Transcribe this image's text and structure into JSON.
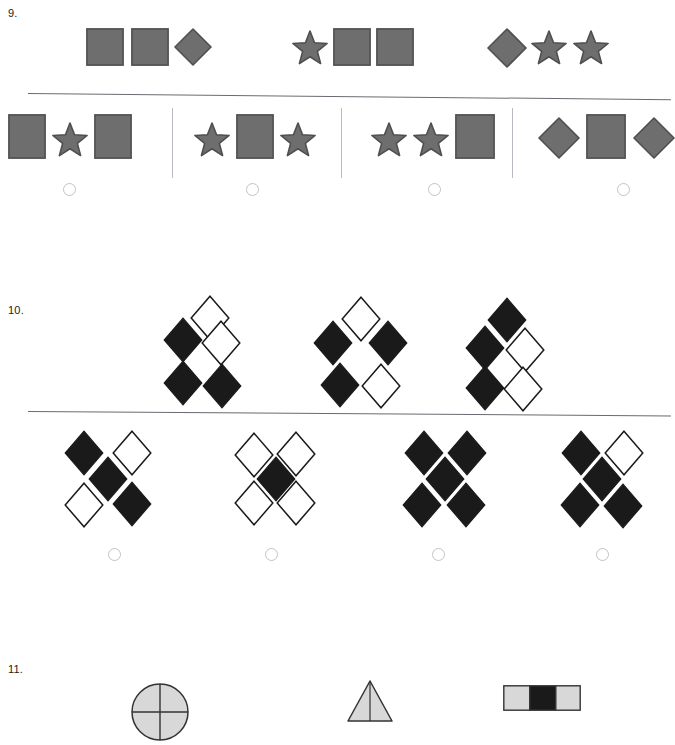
{
  "page": {
    "width": 671,
    "height": 700,
    "background": "#ffffff",
    "type": "abstract-reasoning-worksheet"
  },
  "colors": {
    "gray_fill": "#6e6e6e",
    "gray_stroke": "#4f4f4f",
    "black_fill": "#1a1a1a",
    "white_fill": "#ffffff",
    "divider": "#6a6a72",
    "separator": "#b9b9c2",
    "radio_border": "#c3c3c8",
    "text": "#222222",
    "light_gray_fill": "#d8d8d8"
  },
  "questions": [
    {
      "number": "9.",
      "number_pos": {
        "x": 8,
        "y": 8
      },
      "divider": {
        "x": 28,
        "y": 93,
        "width": 643,
        "angle": 0.55
      },
      "prompt": {
        "label": "sequence-prompt",
        "groups": [
          {
            "name": "prompt-group-1",
            "shapes": [
              {
                "kind": "square",
                "x": 86,
                "y": 28,
                "w": 38,
                "h": 38
              },
              {
                "kind": "square",
                "x": 131,
                "y": 28,
                "w": 38,
                "h": 38
              },
              {
                "kind": "diamond",
                "x": 174,
                "y": 28,
                "w": 38,
                "h": 38
              }
            ]
          },
          {
            "name": "prompt-group-2",
            "shapes": [
              {
                "kind": "star",
                "x": 291,
                "y": 29,
                "w": 38,
                "h": 38
              },
              {
                "kind": "square",
                "x": 333,
                "y": 28,
                "w": 38,
                "h": 38
              },
              {
                "kind": "square",
                "x": 376,
                "y": 28,
                "w": 38,
                "h": 38
              }
            ]
          },
          {
            "name": "prompt-group-3",
            "shapes": [
              {
                "kind": "diamond",
                "x": 487,
                "y": 28,
                "w": 40,
                "h": 40
              },
              {
                "kind": "star",
                "x": 530,
                "y": 29,
                "w": 38,
                "h": 38
              },
              {
                "kind": "star",
                "x": 572,
                "y": 29,
                "w": 38,
                "h": 38
              }
            ]
          }
        ]
      },
      "separators": [
        {
          "x": 172,
          "y": 108,
          "height": 70
        },
        {
          "x": 341,
          "y": 108,
          "height": 70
        },
        {
          "x": 512,
          "y": 108,
          "height": 70
        }
      ],
      "options": [
        {
          "name": "option-a",
          "radio": {
            "x": 63,
            "y": 183
          },
          "shapes": [
            {
              "kind": "square",
              "x": 8,
              "y": 114,
              "w": 38,
              "h": 45
            },
            {
              "kind": "star",
              "x": 51,
              "y": 121,
              "w": 38,
              "h": 38
            },
            {
              "kind": "square",
              "x": 94,
              "y": 114,
              "w": 38,
              "h": 45
            }
          ]
        },
        {
          "name": "option-b",
          "radio": {
            "x": 246,
            "y": 183
          },
          "shapes": [
            {
              "kind": "star",
              "x": 193,
              "y": 121,
              "w": 38,
              "h": 38
            },
            {
              "kind": "square",
              "x": 236,
              "y": 114,
              "w": 38,
              "h": 45
            },
            {
              "kind": "star",
              "x": 279,
              "y": 121,
              "w": 38,
              "h": 38
            }
          ]
        },
        {
          "name": "option-c",
          "radio": {
            "x": 428,
            "y": 183
          },
          "shapes": [
            {
              "kind": "star",
              "x": 370,
              "y": 121,
              "w": 38,
              "h": 38
            },
            {
              "kind": "star",
              "x": 412,
              "y": 121,
              "w": 38,
              "h": 38
            },
            {
              "kind": "square",
              "x": 455,
              "y": 114,
              "w": 40,
              "h": 45
            }
          ]
        },
        {
          "name": "option-d",
          "radio": {
            "x": 617,
            "y": 183
          },
          "shapes": [
            {
              "kind": "diamond",
              "x": 538,
              "y": 117,
              "w": 42,
              "h": 42
            },
            {
              "kind": "square",
              "x": 586,
              "y": 114,
              "w": 40,
              "h": 45
            },
            {
              "kind": "diamond",
              "x": 633,
              "y": 117,
              "w": 42,
              "h": 42
            }
          ]
        }
      ]
    },
    {
      "number": "10.",
      "number_pos": {
        "x": 8,
        "y": 305
      },
      "divider": {
        "x": 28,
        "y": 411,
        "width": 643,
        "angle": 0.4
      },
      "prompt": {
        "label": "diamond-cluster-prompt",
        "groups": [
          {
            "name": "prompt-cluster-1",
            "diamonds": [
              {
                "x": 190,
                "y": 295,
                "filled": false
              },
              {
                "x": 163,
                "y": 317,
                "filled": true
              },
              {
                "x": 201,
                "y": 320,
                "filled": false
              },
              {
                "x": 163,
                "y": 360,
                "filled": true
              },
              {
                "x": 202,
                "y": 363,
                "filled": true
              }
            ]
          },
          {
            "name": "prompt-cluster-2",
            "diamonds": [
              {
                "x": 341,
                "y": 296,
                "filled": false
              },
              {
                "x": 313,
                "y": 320,
                "filled": true
              },
              {
                "x": 368,
                "y": 320,
                "filled": true
              },
              {
                "x": 320,
                "y": 362,
                "filled": true
              },
              {
                "x": 361,
                "y": 363,
                "filled": false
              }
            ]
          },
          {
            "name": "prompt-cluster-3",
            "diamonds": [
              {
                "x": 487,
                "y": 297,
                "filled": true
              },
              {
                "x": 465,
                "y": 325,
                "filled": true
              },
              {
                "x": 505,
                "y": 327,
                "filled": false
              },
              {
                "x": 465,
                "y": 365,
                "filled": true
              },
              {
                "x": 503,
                "y": 366,
                "filled": false
              }
            ]
          }
        ]
      },
      "options": [
        {
          "name": "option-a",
          "radio": {
            "x": 108,
            "y": 548
          },
          "diamonds": [
            {
              "x": 64,
              "y": 430,
              "filled": true
            },
            {
              "x": 112,
              "y": 430,
              "filled": false
            },
            {
              "x": 88,
              "y": 456,
              "filled": true
            },
            {
              "x": 64,
              "y": 482,
              "filled": false
            },
            {
              "x": 112,
              "y": 481,
              "filled": true
            }
          ]
        },
        {
          "name": "option-b",
          "radio": {
            "x": 265,
            "y": 548
          },
          "diamonds": [
            {
              "x": 234,
              "y": 432,
              "filled": false
            },
            {
              "x": 276,
              "y": 431,
              "filled": false
            },
            {
              "x": 256,
              "y": 456,
              "filled": true
            },
            {
              "x": 234,
              "y": 480,
              "filled": false
            },
            {
              "x": 276,
              "y": 480,
              "filled": false
            }
          ]
        },
        {
          "name": "option-c",
          "radio": {
            "x": 432,
            "y": 548
          },
          "diamonds": [
            {
              "x": 404,
              "y": 430,
              "filled": true
            },
            {
              "x": 447,
              "y": 430,
              "filled": true
            },
            {
              "x": 425,
              "y": 456,
              "filled": true
            },
            {
              "x": 402,
              "y": 482,
              "filled": true
            },
            {
              "x": 446,
              "y": 482,
              "filled": true
            }
          ]
        },
        {
          "name": "option-d",
          "radio": {
            "x": 596,
            "y": 548
          },
          "diamonds": [
            {
              "x": 561,
              "y": 430,
              "filled": true
            },
            {
              "x": 604,
              "y": 430,
              "filled": false
            },
            {
              "x": 582,
              "y": 456,
              "filled": true
            },
            {
              "x": 560,
              "y": 482,
              "filled": true
            },
            {
              "x": 603,
              "y": 483,
              "filled": true
            }
          ]
        }
      ]
    },
    {
      "number": "11.",
      "number_pos": {
        "x": 8,
        "y": 664
      },
      "prompt": {
        "label": "partial-bottom-row",
        "items": [
          {
            "kind": "pie-circle",
            "x": 131,
            "y": 683,
            "w": 58,
            "h": 58
          },
          {
            "kind": "triangle",
            "x": 347,
            "y": 680,
            "w": 46,
            "h": 42
          },
          {
            "kind": "striped-bar",
            "x": 503,
            "y": 685,
            "w": 78,
            "h": 26
          }
        ]
      }
    }
  ]
}
